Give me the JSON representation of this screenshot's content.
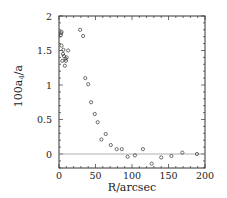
{
  "chart_data": {
    "type": "scatter",
    "title": "",
    "xlabel": "R/arcsec",
    "ylabel": "100a4/a",
    "xlim": [
      0,
      200
    ],
    "ylim": [
      -0.2,
      2
    ],
    "xticks": [
      "0",
      "50",
      "100",
      "150",
      "200"
    ],
    "yticks": [
      "0",
      "0.5",
      "1",
      "1.5",
      "2"
    ],
    "grid": false,
    "reference_line_y": 0,
    "series": [
      {
        "name": "isophote a4",
        "marker": "open-circle",
        "x": [
          2.7,
          3.5,
          2.5,
          3.5,
          4.5,
          5.5,
          6.8,
          6.0,
          8.0,
          9.5,
          10.5,
          12.5,
          9.0,
          29,
          33,
          36,
          40,
          44,
          49,
          53,
          58,
          64,
          71,
          79,
          86,
          94,
          104,
          115,
          127,
          140,
          154,
          169,
          189
        ],
        "y": [
          1.75,
          1.77,
          1.72,
          1.57,
          1.35,
          1.45,
          1.42,
          1.51,
          1.28,
          1.35,
          1.4,
          1.5,
          1.38,
          1.8,
          1.71,
          1.1,
          1.01,
          0.75,
          0.58,
          0.46,
          0.21,
          0.29,
          0.13,
          0.07,
          0.07,
          -0.04,
          -0.02,
          0.07,
          -0.14,
          -0.05,
          -0.03,
          0.02,
          0.0
        ]
      }
    ]
  }
}
